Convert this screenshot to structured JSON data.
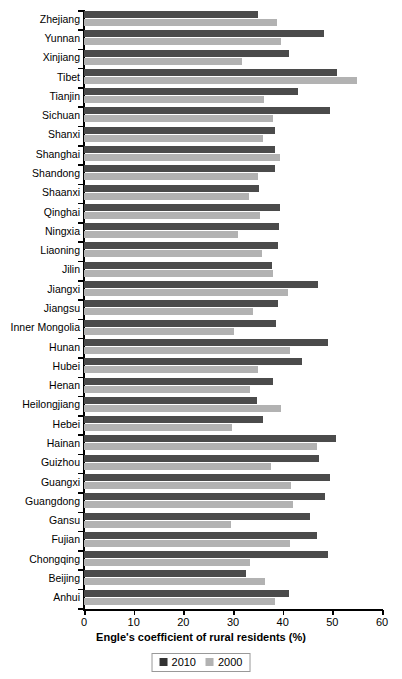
{
  "chart_data": {
    "type": "bar",
    "orientation": "horizontal",
    "title": "",
    "xlabel": "Engle's coefficient of rural residents (%)",
    "ylabel": "",
    "xlim": [
      0,
      60
    ],
    "xticks": [
      0,
      10,
      20,
      30,
      40,
      50,
      60
    ],
    "grid": false,
    "legend_position": "bottom",
    "colors": {
      "2010": "#4b4b4b",
      "2000": "#b2b2b2"
    },
    "categories": [
      "Zhejiang",
      "Yunnan",
      "Xinjiang",
      "Tibet",
      "Tianjin",
      "Sichuan",
      "Shanxi",
      "Shanghai",
      "Shandong",
      "Shaanxi",
      "Qinghai",
      "Ningxia",
      "Liaoning",
      "Jilin",
      "Jiangxi",
      "Jiangsu",
      "Inner Mongolia",
      "Hunan",
      "Hubei",
      "Henan",
      "Heilongjiang",
      "Hebei",
      "Hainan",
      "Guizhou",
      "Guangxi",
      "Guangdong",
      "Gansu",
      "Fujian",
      "Chongqing",
      "Beijing",
      "Anhui"
    ],
    "series": [
      {
        "name": "2010",
        "values": [
          35.0,
          48.3,
          41.2,
          50.9,
          43.1,
          49.5,
          38.4,
          38.4,
          38.4,
          35.2,
          39.4,
          39.2,
          39.0,
          37.8,
          47.1,
          39.0,
          38.6,
          49.1,
          43.9,
          38.0,
          34.8,
          36.0,
          50.7,
          47.3,
          49.5,
          48.5,
          45.5,
          46.9,
          49.1,
          32.6,
          41.2
        ]
      },
      {
        "name": "2000",
        "values": [
          38.8,
          39.6,
          31.8,
          54.9,
          36.2,
          38.0,
          36.0,
          39.4,
          35.0,
          33.2,
          35.4,
          31.0,
          35.8,
          38.0,
          41.0,
          34.0,
          30.2,
          41.4,
          35.0,
          33.4,
          39.6,
          29.8,
          46.9,
          37.6,
          41.6,
          42.0,
          29.6,
          41.4,
          33.4,
          36.4,
          38.4
        ]
      }
    ],
    "legend": [
      "2010",
      "2000"
    ]
  }
}
